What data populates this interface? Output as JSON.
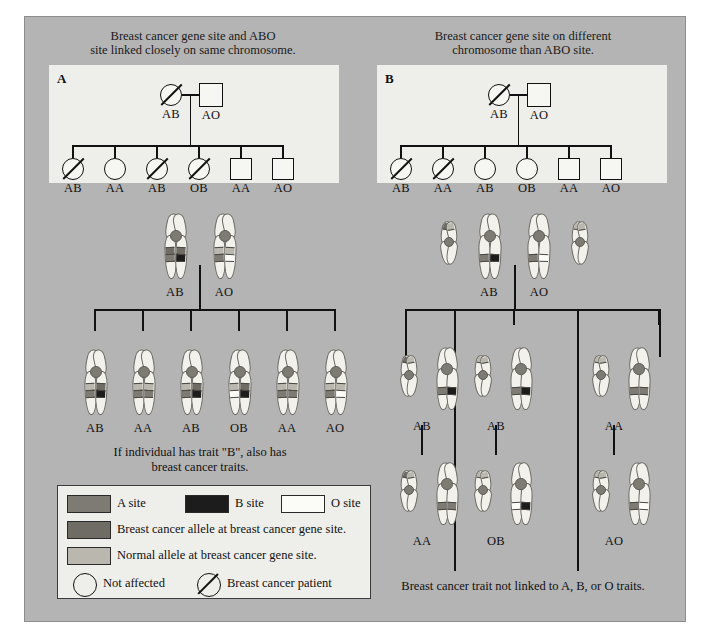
{
  "figure": {
    "background_color": "#b4b4b4",
    "panel_background_color": "#eeeeea"
  },
  "panelA": {
    "letter": "A",
    "title_line1": "Breast cancer gene site and ABO",
    "title_line2": "site linked closely on same chromosome.",
    "parents": [
      {
        "sex": "female",
        "affected": true,
        "genotype": "AB"
      },
      {
        "sex": "male",
        "affected": false,
        "genotype": "AO"
      }
    ],
    "children": [
      {
        "sex": "female",
        "affected": true,
        "genotype": "AB"
      },
      {
        "sex": "female",
        "affected": false,
        "genotype": "AA"
      },
      {
        "sex": "female",
        "affected": true,
        "genotype": "AB"
      },
      {
        "sex": "female",
        "affected": true,
        "genotype": "OB"
      },
      {
        "sex": "male",
        "affected": false,
        "genotype": "AA"
      },
      {
        "sex": "male",
        "affected": false,
        "genotype": "AO"
      }
    ],
    "parent_karyotypes": [
      {
        "genotype": "AB",
        "cancer_bands": [
          "cancer",
          "cancer"
        ],
        "abo_bands": [
          "A",
          "B"
        ]
      },
      {
        "genotype": "AO",
        "cancer_bands": [
          "normal",
          "normal"
        ],
        "abo_bands": [
          "A",
          "O"
        ]
      }
    ],
    "child_karyotypes": [
      {
        "genotype": "AB",
        "cancer_bands": [
          "normal",
          "cancer"
        ],
        "abo_bands": [
          "A",
          "B"
        ]
      },
      {
        "genotype": "AA",
        "cancer_bands": [
          "normal",
          "normal"
        ],
        "abo_bands": [
          "A",
          "A"
        ]
      },
      {
        "genotype": "AB",
        "cancer_bands": [
          "normal",
          "cancer"
        ],
        "abo_bands": [
          "A",
          "B"
        ]
      },
      {
        "genotype": "OB",
        "cancer_bands": [
          "normal",
          "cancer"
        ],
        "abo_bands": [
          "O",
          "B"
        ]
      },
      {
        "genotype": "AA",
        "cancer_bands": [
          "normal",
          "normal"
        ],
        "abo_bands": [
          "A",
          "A"
        ]
      },
      {
        "genotype": "AO",
        "cancer_bands": [
          "normal",
          "normal"
        ],
        "abo_bands": [
          "A",
          "O"
        ]
      }
    ],
    "caption_line1": "If individual has trait \"B\",  also has",
    "caption_line2": "breast cancer traits."
  },
  "panelB": {
    "letter": "B",
    "title_line1": "Breast cancer gene site on different",
    "title_line2": "chromosome than ABO site.",
    "parents": [
      {
        "sex": "female",
        "affected": true,
        "genotype": "AB"
      },
      {
        "sex": "male",
        "affected": false,
        "genotype": "AO"
      }
    ],
    "children": [
      {
        "sex": "female",
        "affected": true,
        "genotype": "AB"
      },
      {
        "sex": "female",
        "affected": true,
        "genotype": "AA"
      },
      {
        "sex": "female",
        "affected": false,
        "genotype": "AB"
      },
      {
        "sex": "female",
        "affected": false,
        "genotype": "OB"
      },
      {
        "sex": "male",
        "affected": false,
        "genotype": "AA"
      },
      {
        "sex": "male",
        "affected": false,
        "genotype": "AO"
      }
    ],
    "parent_karyotypes": [
      {
        "genotype": "AB",
        "cancer_bands": [
          "cancer",
          "normal"
        ],
        "abo_bands": [
          "A",
          "B"
        ]
      },
      {
        "genotype": "AO",
        "cancer_bands": [
          "normal",
          "normal"
        ],
        "abo_bands": [
          "A",
          "O"
        ]
      }
    ],
    "child_karyotypes": [
      {
        "genotype": "AB",
        "cancer_bands": [
          "cancer",
          "normal"
        ],
        "abo_bands": [
          "A",
          "B"
        ]
      },
      {
        "genotype": "AB",
        "cancer_bands": [
          "normal",
          "normal"
        ],
        "abo_bands": [
          "A",
          "B"
        ]
      },
      {
        "genotype": "AA",
        "cancer_bands": [
          "normal",
          "normal"
        ],
        "abo_bands": [
          "A",
          "A"
        ]
      },
      {
        "genotype": "AA",
        "cancer_bands": [
          "cancer",
          "normal"
        ],
        "abo_bands": [
          "A",
          "A"
        ]
      },
      {
        "genotype": "OB",
        "cancer_bands": [
          "normal",
          "normal"
        ],
        "abo_bands": [
          "O",
          "B"
        ]
      },
      {
        "genotype": "AO",
        "cancer_bands": [
          "normal",
          "normal"
        ],
        "abo_bands": [
          "A",
          "O"
        ]
      }
    ],
    "caption": "Breast cancer trait not linked to A, B, or O traits."
  },
  "legend": {
    "sites": [
      {
        "label": "A site",
        "color": "#7d7b74"
      },
      {
        "label": "B site",
        "color": "#1c1c1c"
      },
      {
        "label": "O site",
        "color": "#fbfbf8"
      }
    ],
    "alleles": [
      {
        "label": "Breast cancer allele at breast cancer gene site.",
        "color": "#6e6c65"
      },
      {
        "label": "Normal allele at breast cancer gene site.",
        "color": "#b9b7ae"
      }
    ],
    "status": [
      {
        "label": "Not affected",
        "affected": false
      },
      {
        "label": "Breast cancer patient",
        "affected": true
      }
    ]
  }
}
